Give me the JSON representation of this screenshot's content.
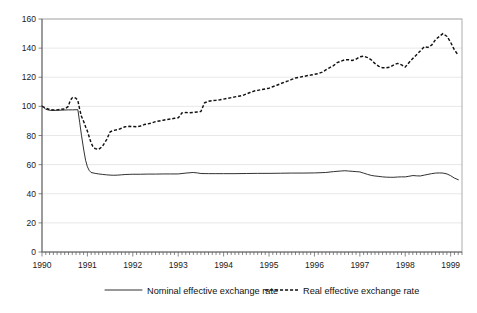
{
  "chart_data": {
    "type": "line",
    "title": "",
    "subtitle": "",
    "xlabel": "",
    "ylabel": "",
    "xlim": [
      1990.0,
      1999.25
    ],
    "ylim": [
      0,
      160
    ],
    "yticks": [
      0,
      20,
      40,
      60,
      80,
      100,
      120,
      140,
      160
    ],
    "xticks": [
      1990,
      1991,
      1992,
      1993,
      1994,
      1995,
      1996,
      1997,
      1998,
      1999
    ],
    "xtick_labels": [
      "1990",
      "1991",
      "1992",
      "1993",
      "1994",
      "1995",
      "1996",
      "1997",
      "1998",
      "1999"
    ],
    "ytick_labels": [
      "0",
      "20",
      "40",
      "60",
      "80",
      "100",
      "120",
      "140",
      "160"
    ],
    "grid": true,
    "grid_axis": "y",
    "legend_position": "bottom",
    "minor_xticks_per_year": 12,
    "series": [
      {
        "name": "Nominal effective exchange rate",
        "style": "solid",
        "color": "#1a1a1a",
        "x": [
          1990.0,
          1990.08,
          1990.17,
          1990.25,
          1990.33,
          1990.42,
          1990.5,
          1990.58,
          1990.67,
          1990.75,
          1990.79,
          1990.83,
          1990.87,
          1990.92,
          1990.96,
          1991.0,
          1991.04,
          1991.08,
          1991.17,
          1991.25,
          1991.33,
          1991.42,
          1991.5,
          1991.58,
          1991.67,
          1991.75,
          1991.83,
          1991.92,
          1992.0,
          1992.17,
          1992.33,
          1992.5,
          1992.67,
          1992.83,
          1993.0,
          1993.17,
          1993.33,
          1993.42,
          1993.5,
          1993.67,
          1993.83,
          1994.0,
          1994.25,
          1994.5,
          1994.75,
          1995.0,
          1995.25,
          1995.5,
          1995.75,
          1996.0,
          1996.25,
          1996.42,
          1996.58,
          1996.67,
          1996.75,
          1996.83,
          1996.92,
          1997.0,
          1997.08,
          1997.17,
          1997.25,
          1997.33,
          1997.42,
          1997.5,
          1997.58,
          1997.67,
          1997.75,
          1997.83,
          1997.92,
          1998.0,
          1998.08,
          1998.17,
          1998.25,
          1998.33,
          1998.42,
          1998.5,
          1998.58,
          1998.67,
          1998.75,
          1998.83,
          1998.92,
          1999.0,
          1999.08,
          1999.17
        ],
        "y": [
          100.5,
          98.0,
          97.3,
          97.2,
          97.3,
          97.4,
          97.5,
          97.6,
          97.6,
          97.7,
          97.7,
          89.0,
          80.0,
          70.0,
          63.0,
          58.5,
          56.0,
          54.6,
          54.0,
          53.6,
          53.3,
          53.0,
          52.8,
          52.7,
          52.8,
          53.0,
          53.2,
          53.3,
          53.4,
          53.4,
          53.5,
          53.5,
          53.6,
          53.6,
          53.6,
          54.2,
          54.6,
          54.3,
          53.9,
          53.8,
          53.8,
          53.8,
          53.8,
          53.9,
          54.0,
          54.0,
          54.1,
          54.2,
          54.2,
          54.3,
          54.6,
          55.2,
          55.6,
          55.8,
          55.6,
          55.4,
          55.2,
          55.0,
          54.2,
          53.3,
          52.6,
          52.2,
          51.9,
          51.6,
          51.4,
          51.3,
          51.3,
          51.5,
          51.6,
          51.6,
          52.0,
          52.5,
          52.3,
          52.2,
          52.8,
          53.3,
          53.8,
          54.2,
          54.3,
          54.2,
          53.6,
          52.4,
          50.8,
          49.6
        ]
      },
      {
        "name": "Real effective exchange rate",
        "style": "dashed",
        "color": "#111111",
        "x": [
          1990.0,
          1990.08,
          1990.17,
          1990.25,
          1990.33,
          1990.42,
          1990.5,
          1990.58,
          1990.62,
          1990.67,
          1990.71,
          1990.75,
          1990.79,
          1990.83,
          1990.87,
          1990.92,
          1990.96,
          1991.0,
          1991.04,
          1991.08,
          1991.12,
          1991.17,
          1991.25,
          1991.33,
          1991.42,
          1991.5,
          1991.58,
          1991.67,
          1991.75,
          1991.83,
          1991.92,
          1992.0,
          1992.08,
          1992.17,
          1992.25,
          1992.33,
          1992.42,
          1992.5,
          1992.58,
          1992.67,
          1992.75,
          1992.83,
          1992.92,
          1993.0,
          1993.04,
          1993.08,
          1993.17,
          1993.25,
          1993.33,
          1993.42,
          1993.5,
          1993.58,
          1993.67,
          1993.75,
          1993.83,
          1993.92,
          1994.0,
          1994.08,
          1994.17,
          1994.25,
          1994.33,
          1994.42,
          1994.5,
          1994.58,
          1994.67,
          1994.75,
          1994.83,
          1994.92,
          1995.0,
          1995.08,
          1995.17,
          1995.25,
          1995.33,
          1995.42,
          1995.5,
          1995.58,
          1995.67,
          1995.75,
          1995.83,
          1995.92,
          1996.0,
          1996.08,
          1996.17,
          1996.25,
          1996.33,
          1996.42,
          1996.5,
          1996.58,
          1996.67,
          1996.75,
          1996.83,
          1996.92,
          1997.0,
          1997.08,
          1997.17,
          1997.25,
          1997.33,
          1997.42,
          1997.5,
          1997.58,
          1997.67,
          1997.75,
          1997.83,
          1997.92,
          1998.0,
          1998.08,
          1998.17,
          1998.25,
          1998.33,
          1998.42,
          1998.5,
          1998.58,
          1998.67,
          1998.75,
          1998.83,
          1998.92,
          1999.0,
          1999.08,
          1999.17
        ],
        "y": [
          100.0,
          98.8,
          97.8,
          97.5,
          97.6,
          98.0,
          98.2,
          100.0,
          104.0,
          106.0,
          106.2,
          105.5,
          104.0,
          98.0,
          93.0,
          89.5,
          86.0,
          83.0,
          79.0,
          75.0,
          72.5,
          71.0,
          70.5,
          72.5,
          77.0,
          82.5,
          83.5,
          84.0,
          85.0,
          86.0,
          86.3,
          86.2,
          86.0,
          86.5,
          87.5,
          88.0,
          88.6,
          89.5,
          90.0,
          90.5,
          91.0,
          91.3,
          91.8,
          92.2,
          93.5,
          95.5,
          95.8,
          95.6,
          95.8,
          96.2,
          96.5,
          102.5,
          103.5,
          104.0,
          104.2,
          104.5,
          105.0,
          105.5,
          106.0,
          106.5,
          107.0,
          107.5,
          108.5,
          109.5,
          110.5,
          111.0,
          111.5,
          112.0,
          112.5,
          113.5,
          114.5,
          115.5,
          116.5,
          117.5,
          118.5,
          119.5,
          120.0,
          120.5,
          121.0,
          121.5,
          122.0,
          122.5,
          123.5,
          125.0,
          126.5,
          128.0,
          130.0,
          131.0,
          132.0,
          132.0,
          131.5,
          132.5,
          134.0,
          134.5,
          133.5,
          132.0,
          129.5,
          127.5,
          126.5,
          126.5,
          127.0,
          128.5,
          129.5,
          128.5,
          127.0,
          130.0,
          133.0,
          135.5,
          138.0,
          141.0,
          140.5,
          142.0,
          146.0,
          148.0,
          150.0,
          148.0,
          144.0,
          139.0,
          135.0
        ]
      }
    ]
  },
  "legend": {
    "entries": [
      {
        "label": "Nominal effective exchange rate",
        "marker": "solid-line"
      },
      {
        "label": "Real effective exchange rate",
        "marker": "dashed-line"
      }
    ]
  }
}
